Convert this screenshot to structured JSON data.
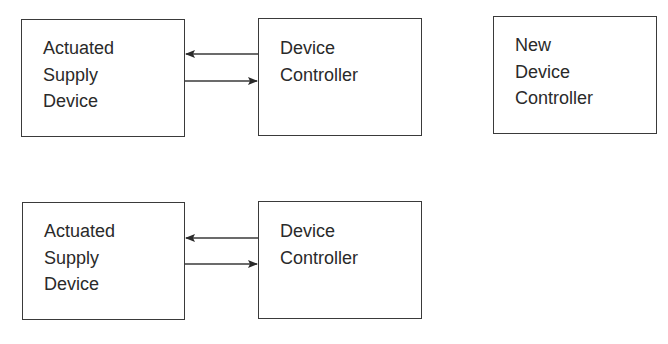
{
  "diagram": {
    "top_row": {
      "left_box": {
        "label": "Actuated\nSupply\nDevice"
      },
      "right_box": {
        "label": "Device\nController"
      },
      "arrows": [
        {
          "from": "Device Controller",
          "to": "Actuated Supply Device",
          "direction": "left"
        },
        {
          "from": "Actuated Supply Device",
          "to": "Device Controller",
          "direction": "right"
        }
      ]
    },
    "new_box": {
      "label": "New\nDevice\nController"
    },
    "bottom_row": {
      "left_box": {
        "label": "Actuated\nSupply\nDevice"
      },
      "right_box": {
        "label": "Device\nController"
      },
      "arrows": [
        {
          "from": "Device Controller",
          "to": "Actuated Supply Device",
          "direction": "left"
        },
        {
          "from": "Actuated Supply Device",
          "to": "Device Controller",
          "direction": "right"
        }
      ]
    },
    "colors": {
      "stroke": "#3a3a3a",
      "text": "#2a2a2a",
      "background": "#ffffff"
    }
  }
}
